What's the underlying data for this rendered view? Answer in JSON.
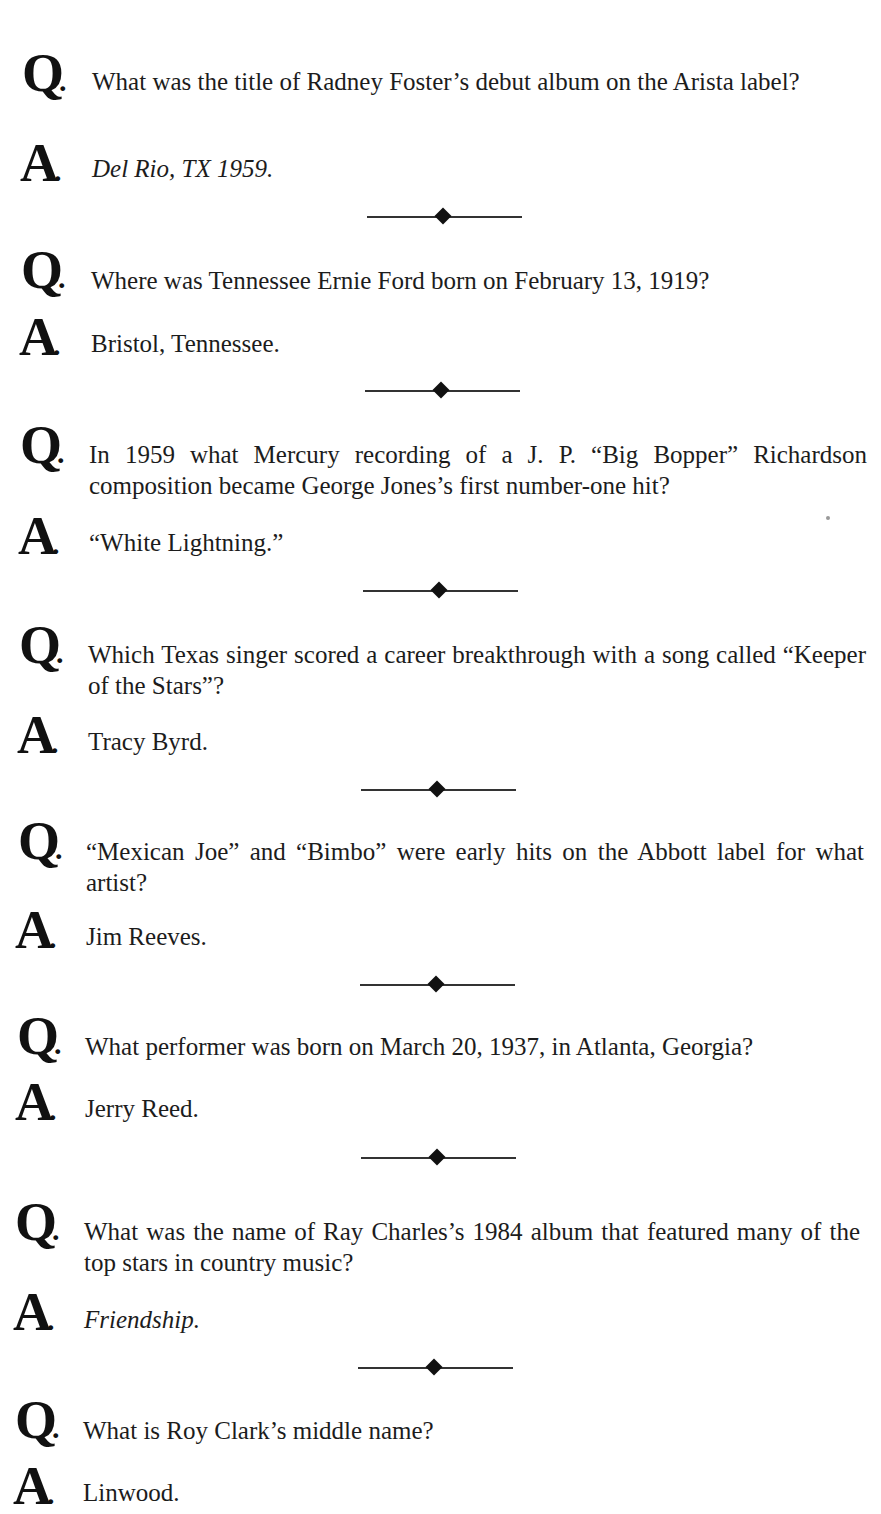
{
  "page": {
    "running_header": "· · · · ·  · · · · ·"
  },
  "markers": {
    "question": "Q",
    "answer": "A",
    "dot": "."
  },
  "qa": [
    {
      "question": "What was the title of Radney Foster’s debut album on the Arista label?",
      "answer": "Del Rio, TX 1959.",
      "answer_italic": true
    },
    {
      "question": "Where was Tennessee Ernie Ford born on February 13, 1919?",
      "answer": "Bristol, Tennessee.",
      "answer_italic": false
    },
    {
      "question": "In 1959 what Mercury recording of a J. P. “Big Bopper” Richardson composition became George Jones’s first number-one hit?",
      "answer": "“White Lightning.”",
      "answer_italic": false
    },
    {
      "question": "Which Texas singer scored a career breakthrough with a song called “Keeper of the Stars”?",
      "answer": "Tracy Byrd.",
      "answer_italic": false
    },
    {
      "question": "“Mexican Joe” and “Bimbo” were early hits on the Abbott label for what artist?",
      "answer": "Jim Reeves.",
      "answer_italic": false
    },
    {
      "question": "What performer was born on March 20, 1937, in Atlanta, Georgia?",
      "answer": "Jerry Reed.",
      "answer_italic": false
    },
    {
      "question": "What was the name of Ray Charles’s 1984 album that featured many of the top stars in country music?",
      "answer": "Friendship.",
      "answer_italic": true
    },
    {
      "question": "What is Roy Clark’s middle name?",
      "answer": "Linwood.",
      "answer_italic": false
    }
  ],
  "divider_icon": "diamond-rule"
}
